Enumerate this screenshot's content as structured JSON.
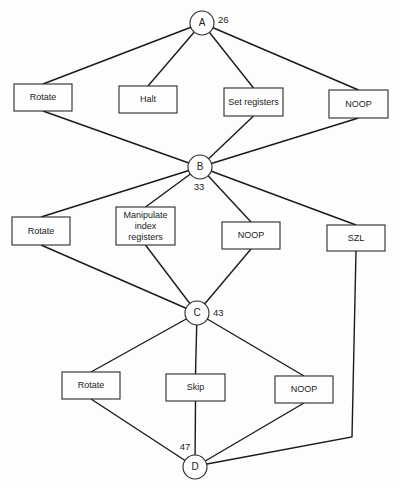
{
  "nodes": [
    {
      "id": "A",
      "label": "A",
      "annotation": "26"
    },
    {
      "id": "B",
      "label": "B",
      "annotation": "33"
    },
    {
      "id": "C",
      "label": "C",
      "annotation": "43"
    },
    {
      "id": "D",
      "label": "D",
      "annotation": "47"
    }
  ],
  "stages": [
    {
      "from": "A",
      "to": "B",
      "operations": [
        {
          "lines": [
            "Rotate"
          ]
        },
        {
          "lines": [
            "Halt"
          ]
        },
        {
          "lines": [
            "Set registers"
          ]
        },
        {
          "lines": [
            "NOOP"
          ]
        }
      ]
    },
    {
      "from": "B",
      "to": "C",
      "operations": [
        {
          "lines": [
            "Rotate"
          ]
        },
        {
          "lines": [
            "Manipulate",
            "index",
            "registers"
          ]
        },
        {
          "lines": [
            "NOOP"
          ]
        },
        {
          "lines": [
            "SZL"
          ],
          "connects_to": "D"
        }
      ]
    },
    {
      "from": "C",
      "to": "D",
      "operations": [
        {
          "lines": [
            "Rotate"
          ]
        },
        {
          "lines": [
            "Skip"
          ]
        },
        {
          "lines": [
            "NOOP"
          ]
        }
      ]
    }
  ],
  "dead_ends": [
    "Halt"
  ],
  "caption": ""
}
